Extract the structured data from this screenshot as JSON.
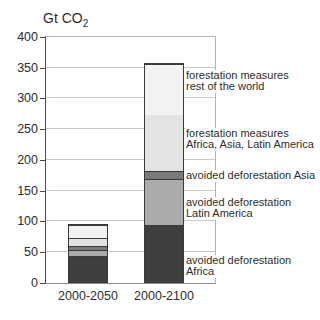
{
  "chart_data": {
    "type": "bar",
    "stacked": true,
    "title": "Gt CO",
    "title_sub": "2",
    "ylabel": "Gt CO2",
    "categories": [
      "2000-2050",
      "2000-2100"
    ],
    "series": [
      {
        "key": "avoided-deforestation-africa",
        "name": "avoided deforestation Africa",
        "values": [
          42,
          93
        ],
        "color": "#3f3f3f"
      },
      {
        "key": "avoided-deforestation-latin-america",
        "name": "avoided deforestation Latin America",
        "values": [
          10,
          74
        ],
        "color": "#ababab"
      },
      {
        "key": "avoided-deforestation-asia",
        "name": "avoided deforestation Asia",
        "values": [
          6,
          13
        ],
        "color": "#7a7a7a"
      },
      {
        "key": "forestation-africa-asia-latin-america",
        "name": "forestation measures Africa, Asia, Latin America",
        "values": [
          13,
          92
        ],
        "color": "#e3e3e3"
      },
      {
        "key": "forestation-rest-of-world",
        "name": "forestation measures rest of the world",
        "values": [
          21,
          83
        ],
        "color": "#f3f3f3"
      }
    ],
    "totals": [
      92,
      355
    ],
    "ylim": [
      0,
      400
    ],
    "yticks": [
      0,
      50,
      100,
      150,
      200,
      250,
      300,
      350,
      400
    ],
    "grid": true,
    "legend_position": "right-annotations"
  },
  "annotations": [
    {
      "key": "forestation-rest-of-world",
      "lines": [
        "forestation measures",
        "rest of the world"
      ],
      "top": 70
    },
    {
      "key": "forestation-africa-asia-latin-america",
      "lines": [
        "forestation measures",
        "Africa, Asia, Latin America"
      ],
      "top": 128
    },
    {
      "key": "avoided-deforestation-asia",
      "lines": [
        "avoided deforestation Asia"
      ],
      "top": 170
    },
    {
      "key": "avoided-deforestation-latin-america",
      "lines": [
        "avoided deforestation",
        "Latin America"
      ],
      "top": 197
    },
    {
      "key": "avoided-deforestation-africa",
      "lines": [
        "avoided deforestation",
        "Africa"
      ],
      "top": 255
    }
  ],
  "colors": {
    "background": "#ffffff",
    "text": "#2e2e2e",
    "gridline": "#c9c9c9",
    "axis": "#4a4a4a",
    "frame": "#b5b5b5",
    "segment_border": "#3a3a3a"
  }
}
